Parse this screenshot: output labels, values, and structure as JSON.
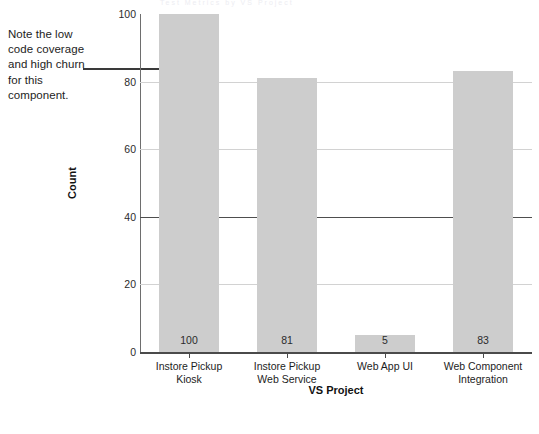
{
  "annotation": {
    "text": "Note the low code coverage and high churn for this component."
  },
  "top_clipped_text": "Test Metrics by VS Project",
  "chart_data": {
    "type": "bar",
    "title": "",
    "xlabel": "VS Project",
    "ylabel": "Count",
    "ylim": [
      0,
      100
    ],
    "yticks": [
      0,
      20,
      40,
      60,
      80,
      100
    ],
    "grid": true,
    "legend_position": "bottom-left",
    "categories": [
      "Instore Pickup Kiosk",
      "Instore Pickup Web Service",
      "Web App UI",
      "Web Component Integration"
    ],
    "category_lines": [
      [
        "Instore Pickup",
        "Kiosk"
      ],
      [
        "Instore Pickup",
        "Web Service"
      ],
      [
        "Web App UI",
        ""
      ],
      [
        "Web Component",
        "Integration"
      ]
    ],
    "series": [
      {
        "name": "Tests Passed (Scale: x1)",
        "type": "bar",
        "color": "#cdcdcd",
        "values": [
          100,
          81,
          5,
          83
        ]
      },
      {
        "name": "Percentage Code Coverage",
        "type": "line",
        "color": "#1a1a1a",
        "values": [
          22,
          95,
          85,
          77
        ]
      },
      {
        "name": "Code Churn (Scale: x.001)",
        "type": "line",
        "color": "#6b6b6b",
        "values": [
          71,
          61,
          56,
          66
        ]
      }
    ]
  },
  "legend": {
    "items": [
      {
        "label": "Code Churn (Scale: x.001)",
        "key": "line-thin"
      },
      {
        "label": "Percentage Code Coverage",
        "key": "line-thick"
      },
      {
        "label": "Tests Passed (Scale: x1)",
        "key": "swatch"
      }
    ]
  }
}
